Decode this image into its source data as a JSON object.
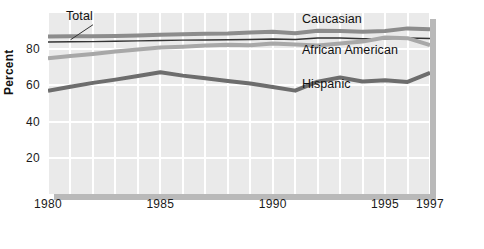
{
  "chart_data": {
    "type": "line",
    "title": "",
    "subtitle": "",
    "xlabel": "",
    "ylabel": "Percent",
    "xlim": [
      1980,
      1997
    ],
    "ylim": [
      0,
      100
    ],
    "grid": true,
    "legend_position": "inline-annotations",
    "x": [
      1980,
      1981,
      1982,
      1983,
      1984,
      1985,
      1986,
      1987,
      1988,
      1989,
      1990,
      1991,
      1992,
      1993,
      1994,
      1995,
      1996,
      1997
    ],
    "xticks": [
      "1980",
      "1985",
      "1990",
      "1995",
      "1997"
    ],
    "xtick_values": [
      1980,
      1985,
      1990,
      1995,
      1997
    ],
    "yticks": [
      "20",
      "40",
      "60",
      "80"
    ],
    "ytick_values": [
      20,
      40,
      60,
      80
    ],
    "series": [
      {
        "name": "Caucasian",
        "color": "#8c8c8c",
        "width": 4,
        "label_x": 1991.3,
        "label_y": 96,
        "values": [
          87,
          87.1,
          87.2,
          87.3,
          87.6,
          88,
          88.3,
          88.6,
          88.7,
          89.2,
          89.6,
          88.8,
          90.2,
          90.1,
          89.7,
          90.1,
          91.5,
          91
        ]
      },
      {
        "name": "Total",
        "color": "#333333",
        "width": 1.4,
        "label_x": 1980.8,
        "label_y": 98,
        "values": [
          84,
          84.1,
          84.2,
          84.4,
          84.6,
          84.8,
          85,
          85.1,
          85.2,
          85.4,
          85.6,
          85.4,
          86.2,
          86.2,
          85.8,
          85.8,
          86.2,
          85.9
        ]
      },
      {
        "name": "African American",
        "color": "#a8a8a8",
        "width": 4,
        "label_x": 1991.3,
        "label_y": 79,
        "values": [
          75,
          76.2,
          77.4,
          78.7,
          79.8,
          80.9,
          81.4,
          82.1,
          82.4,
          82.2,
          83.2,
          82.6,
          82.1,
          83.1,
          84.2,
          86.5,
          86.1,
          82.3
        ]
      },
      {
        "name": "Hispanic",
        "color": "#6d6d6d",
        "width": 4,
        "label_x": 1991.3,
        "label_y": 60,
        "values": [
          57,
          59.3,
          61.4,
          63.2,
          65.2,
          67.3,
          65.4,
          64,
          62.4,
          61,
          59.1,
          57.1,
          62.1,
          64.4,
          62.2,
          62.9,
          61.9,
          67
        ]
      }
    ]
  },
  "labels": {
    "total": "Total",
    "caucasian": "Caucasian",
    "african_american": "African American",
    "hispanic": "Hispanic",
    "percent": "Percent"
  },
  "colors": {
    "plot_background": "#eaeaea",
    "gridline": "#ffffff",
    "shadow": "#b9b9b9",
    "text": "#111111"
  }
}
